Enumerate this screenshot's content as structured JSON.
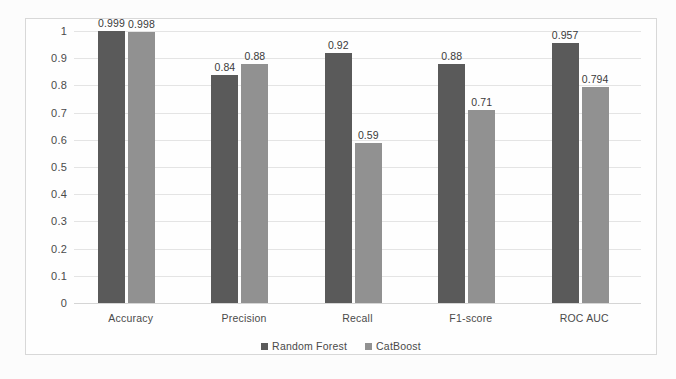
{
  "chart_data": {
    "type": "bar",
    "title": "",
    "subtitle": "",
    "xlabel": "",
    "ylabel": "",
    "ylim": [
      0,
      1
    ],
    "yticks": [
      "1",
      "0.9",
      "0.8",
      "0.7",
      "0.6",
      "0.5",
      "0.4",
      "0.3",
      "0.2",
      "0.1",
      "0"
    ],
    "ytick_values": [
      1,
      0.9,
      0.8,
      0.7,
      0.6,
      0.5,
      0.4,
      0.3,
      0.2,
      0.1,
      0
    ],
    "grid": true,
    "legend_position": "bottom",
    "categories": [
      "Accuracy",
      "Precision",
      "Recall",
      "F1-score",
      "ROC AUC"
    ],
    "series": [
      {
        "name": "Random Forest",
        "color": "#5a5a5a",
        "values": [
          0.999,
          0.84,
          0.92,
          0.88,
          0.957
        ],
        "labels": [
          "0.999",
          "0.84",
          "0.92",
          "0.88",
          "0.957"
        ]
      },
      {
        "name": "CatBoost",
        "color": "#919191",
        "values": [
          0.998,
          0.88,
          0.59,
          0.71,
          0.794
        ],
        "labels": [
          "0.998",
          "0.88",
          "0.59",
          "0.71",
          "0.794"
        ]
      }
    ]
  }
}
